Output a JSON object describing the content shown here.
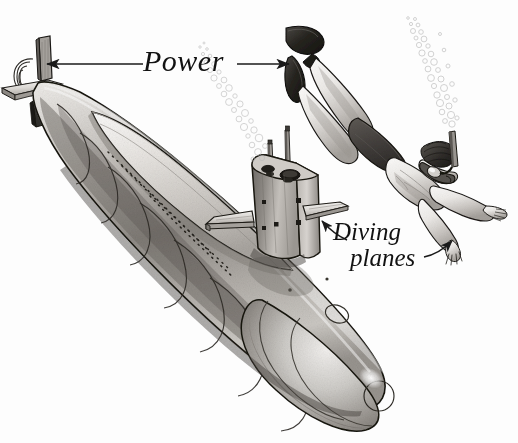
{
  "illustration": {
    "title": "Submarine and scuba diver comparison diagram",
    "style": "graphite pen-and-ink technical illustration, greyscale",
    "background_color": "#fdfdfd",
    "ink_color": "#1a1a1a"
  },
  "labels": {
    "power": "Power",
    "diving_planes_line1": "Diving",
    "diving_planes_line2": "planes"
  },
  "annotations": {
    "power_arrow_left_target": "submarine stern rudder and propeller",
    "power_arrow_right_target": "diver swim fins",
    "diving_arrow_left_target": "submarine sail-mounted diving plane",
    "diving_arrow_right_target": "diver outstretched hand"
  },
  "subjects": {
    "submarine": {
      "name": "nuclear submarine",
      "parts": [
        "hull",
        "ring frames",
        "conning tower sail",
        "periscope masts",
        "sail diving planes",
        "stern planes",
        "rudder",
        "propeller shroud",
        "bow sonar dome",
        "hatches"
      ]
    },
    "diver": {
      "name": "scuba diver",
      "parts": [
        "swim fins",
        "legs",
        "swim trunks",
        "torso",
        "arms",
        "hands",
        "head",
        "hair",
        "dive mask",
        "snorkel"
      ]
    },
    "bubbles": {
      "submarine_trail": "bubble stream rising from sail",
      "diver_trail": "bubble stream rising from snorkel"
    }
  },
  "palette": {
    "ink": "#1a1a1a",
    "hull_light": "#e8e6e3",
    "hull_mid": "#b5b2ae",
    "hull_dark": "#7c7873",
    "hull_shadow": "#55514c",
    "skin_light": "#f2f0ed",
    "skin_mid": "#cbc8c4",
    "trunks_dark": "#4a4641",
    "fin_dark": "#2b2927",
    "bubble": "#cfcfcf"
  }
}
